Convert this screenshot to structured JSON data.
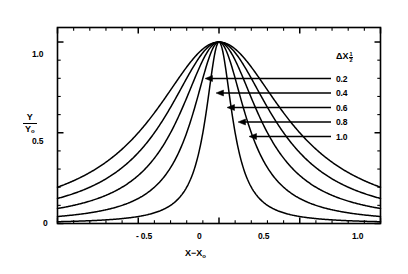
{
  "chart_data": {
    "type": "line",
    "title": "",
    "subtitle": "",
    "xlabel": "X−X₀",
    "ylabel": "Y/Y₀",
    "xlim": [
      -1.0,
      1.0
    ],
    "ylim": [
      0.0,
      1.08
    ],
    "grid": false,
    "legend_position": "right-inside",
    "legend_title": "ΔX½",
    "x_ticks_major": [
      -0.5,
      0,
      0.5
    ],
    "x_tick_labels": [
      "- 0.5",
      "0",
      "0.5"
    ],
    "x_axis_end_label": "1.0",
    "y_ticks_major": [
      0,
      0.5,
      1.0
    ],
    "y_tick_labels": [
      "0",
      "0.5",
      "1.0"
    ],
    "x_minor_tick_step": 0.1,
    "y_minor_tick_step": 0.1,
    "profile_shape": "lorentzian",
    "peak_value": 1.0,
    "peak_x": 0.0,
    "series": [
      {
        "name": "0.2",
        "half_width": 0.2,
        "label": "0.2",
        "x": [
          -1.0,
          -0.9,
          -0.8,
          -0.7,
          -0.6,
          -0.5,
          -0.45,
          -0.4,
          -0.35,
          -0.3,
          -0.25,
          -0.2,
          -0.15,
          -0.1,
          -0.05,
          0.0,
          0.05,
          0.1,
          0.15,
          0.2,
          0.25,
          0.3,
          0.35,
          0.4,
          0.45,
          0.5,
          0.6,
          0.7,
          0.8,
          0.9,
          1.0
        ],
        "values": [
          0.0099,
          0.0122,
          0.0154,
          0.02,
          0.027,
          0.0385,
          0.0471,
          0.0588,
          0.0755,
          0.1,
          0.1379,
          0.2,
          0.3077,
          0.5,
          0.8,
          1.0,
          0.8,
          0.5,
          0.3077,
          0.2,
          0.1379,
          0.1,
          0.0755,
          0.0588,
          0.0471,
          0.0385,
          0.027,
          0.02,
          0.0154,
          0.0122,
          0.0099
        ]
      },
      {
        "name": "0.4",
        "half_width": 0.4,
        "label": "0.4",
        "x": [
          -1.0,
          -0.9,
          -0.8,
          -0.7,
          -0.6,
          -0.5,
          -0.45,
          -0.4,
          -0.35,
          -0.3,
          -0.25,
          -0.2,
          -0.15,
          -0.1,
          -0.05,
          0.0,
          0.05,
          0.1,
          0.15,
          0.2,
          0.25,
          0.3,
          0.35,
          0.4,
          0.45,
          0.5,
          0.6,
          0.7,
          0.8,
          0.9,
          1.0
        ],
        "values": [
          0.0385,
          0.0471,
          0.0588,
          0.0755,
          0.1,
          0.1379,
          0.1649,
          0.2,
          0.2462,
          0.3077,
          0.3902,
          0.5,
          0.64,
          0.8,
          0.9412,
          1.0,
          0.9412,
          0.8,
          0.64,
          0.5,
          0.3902,
          0.3077,
          0.2462,
          0.2,
          0.1649,
          0.1379,
          0.1,
          0.0755,
          0.0588,
          0.0471,
          0.0385
        ]
      },
      {
        "name": "0.6",
        "half_width": 0.6,
        "label": "0.6",
        "x": [
          -1.0,
          -0.9,
          -0.8,
          -0.7,
          -0.6,
          -0.5,
          -0.45,
          -0.4,
          -0.35,
          -0.3,
          -0.25,
          -0.2,
          -0.15,
          -0.1,
          -0.05,
          0.0,
          0.05,
          0.1,
          0.15,
          0.2,
          0.25,
          0.3,
          0.35,
          0.4,
          0.45,
          0.5,
          0.6,
          0.7,
          0.8,
          0.9,
          1.0
        ],
        "values": [
          0.0826,
          0.1,
          0.1233,
          0.1552,
          0.2,
          0.2647,
          0.3077,
          0.36,
          0.4235,
          0.5,
          0.5902,
          0.6923,
          0.8,
          0.9,
          0.973,
          1.0,
          0.973,
          0.9,
          0.8,
          0.6923,
          0.5902,
          0.5,
          0.4235,
          0.36,
          0.3077,
          0.2647,
          0.2,
          0.1552,
          0.1233,
          0.1,
          0.0826
        ]
      },
      {
        "name": "0.8",
        "half_width": 0.8,
        "label": "0.8",
        "x": [
          -1.0,
          -0.9,
          -0.8,
          -0.7,
          -0.6,
          -0.5,
          -0.45,
          -0.4,
          -0.35,
          -0.3,
          -0.25,
          -0.2,
          -0.15,
          -0.1,
          -0.05,
          0.0,
          0.05,
          0.1,
          0.15,
          0.2,
          0.25,
          0.3,
          0.35,
          0.4,
          0.45,
          0.5,
          0.6,
          0.7,
          0.8,
          0.9,
          1.0
        ],
        "values": [
          0.1379,
          0.1649,
          0.2,
          0.2462,
          0.3077,
          0.3902,
          0.4412,
          0.5,
          0.5673,
          0.64,
          0.7191,
          0.8,
          0.8767,
          0.9412,
          0.9846,
          1.0,
          0.9846,
          0.9412,
          0.8767,
          0.8,
          0.7191,
          0.64,
          0.5673,
          0.5,
          0.4412,
          0.3902,
          0.3077,
          0.2462,
          0.2,
          0.1649,
          0.1379
        ]
      },
      {
        "name": "1.0",
        "half_width": 1.0,
        "label": "1.0",
        "x": [
          -1.0,
          -0.9,
          -0.8,
          -0.7,
          -0.6,
          -0.5,
          -0.45,
          -0.4,
          -0.35,
          -0.3,
          -0.25,
          -0.2,
          -0.15,
          -0.1,
          -0.05,
          0.0,
          0.05,
          0.1,
          0.15,
          0.2,
          0.25,
          0.3,
          0.35,
          0.4,
          0.45,
          0.5,
          0.6,
          0.7,
          0.8,
          0.9,
          1.0
        ],
        "values": [
          0.2,
          0.232,
          0.2703,
          0.315,
          0.3659,
          0.4211,
          0.4494,
          0.4808,
          0.5106,
          0.5405,
          0.5714,
          0.6154,
          0.6504,
          0.7143,
          0.7407,
          1.0,
          0.7407,
          0.7143,
          0.6504,
          0.6154,
          0.5714,
          0.5405,
          0.5106,
          0.4808,
          0.4494,
          0.4211,
          0.3659,
          0.315,
          0.2703,
          0.232,
          0.2
        ]
      }
    ],
    "legend_entries": [
      "0.2",
      "0.4",
      "0.6",
      "0.8",
      "1.0"
    ]
  },
  "axes": {
    "y_label_numerator": "Y",
    "y_label_denominator": "Y",
    "y_label_denominator_sub": "o",
    "x_label_main": "X−X",
    "x_label_sub": "o"
  },
  "legend": {
    "title_symbol": "ΔX",
    "title_sub_num": "1",
    "title_sub_den": "2",
    "items": [
      {
        "label": "0.2"
      },
      {
        "label": "0.4"
      },
      {
        "label": "0.6"
      },
      {
        "label": "0.8"
      },
      {
        "label": "1.0"
      }
    ]
  },
  "ticks": {
    "x": [
      {
        "label": "- 0.5",
        "left": 136,
        "top": 231
      },
      {
        "label": "0",
        "left": 197,
        "top": 231
      },
      {
        "label": "0.5",
        "left": 258,
        "top": 231
      },
      {
        "label": "1.0",
        "left": 352,
        "top": 231
      }
    ],
    "y": [
      {
        "label": "1.0",
        "left": 32,
        "top": 49
      },
      {
        "label": "0.5",
        "left": 32,
        "top": 136
      },
      {
        "label": "0",
        "left": 43,
        "top": 218
      }
    ]
  },
  "colors": {
    "line": "#000000",
    "axis": "#000000",
    "background": "#ffffff"
  }
}
